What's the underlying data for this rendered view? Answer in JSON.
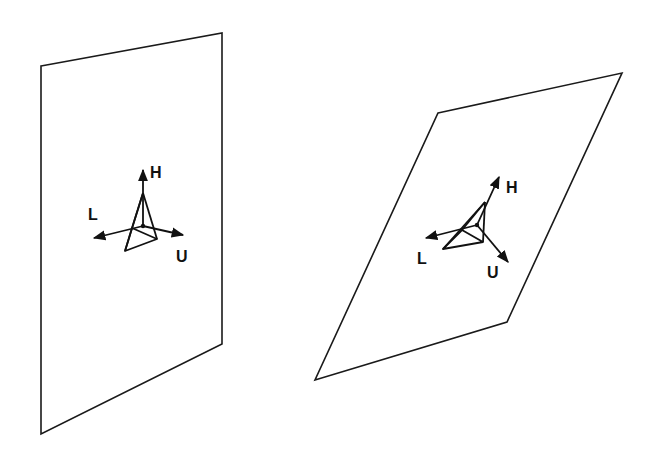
{
  "figure": {
    "panels": [
      {
        "name": "vertical-plane",
        "plane_corners": [
          [
            41,
            66
          ],
          [
            222,
            33
          ],
          [
            222,
            344
          ],
          [
            41,
            434
          ]
        ],
        "frame": {
          "center": [
            143,
            226
          ],
          "apex": [
            143,
            193
          ],
          "base": [
            [
              132,
              228
            ],
            [
              125,
              251
            ],
            [
              157,
              239
            ]
          ],
          "axes": {
            "H": {
              "label": "H",
              "tip": [
                143,
                170
              ],
              "label_pos": [
                150,
                178
              ]
            },
            "L": {
              "label": "L",
              "tip": [
                94,
                238
              ],
              "label_pos": [
                88,
                220
              ]
            },
            "U": {
              "label": "U",
              "tip": [
                183,
                235
              ],
              "label_pos": [
                176,
                262
              ]
            }
          }
        }
      },
      {
        "name": "tilted-plane",
        "plane_corners": [
          [
            438,
            113
          ],
          [
            622,
            73
          ],
          [
            507,
            322
          ],
          [
            315,
            380
          ]
        ],
        "frame": {
          "center": [
            477,
            225
          ],
          "apex": [
            485,
            202
          ],
          "base": [
            [
              462,
              230
            ],
            [
              443,
              249
            ],
            [
              483,
              242
            ]
          ],
          "axes": {
            "H": {
              "label": "H",
              "tip": [
                499,
                177
              ],
              "label_pos": [
                506,
                193
              ]
            },
            "L": {
              "label": "L",
              "tip": [
                426,
                238
              ],
              "label_pos": [
                417,
                264
              ]
            },
            "U": {
              "label": "U",
              "tip": [
                508,
                262
              ],
              "label_pos": [
                487,
                278
              ]
            }
          }
        }
      }
    ]
  }
}
